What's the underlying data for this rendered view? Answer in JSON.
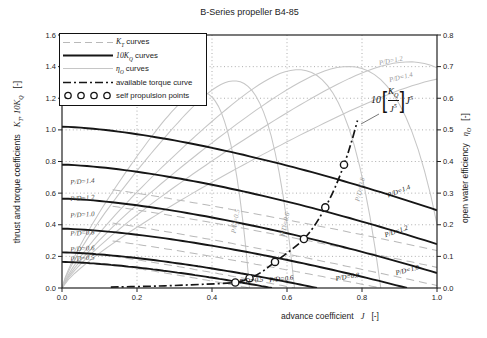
{
  "colors": {
    "curve_dark": "#161616",
    "curve_light": "#b9b9b9",
    "eta_light": "#c6c6c6",
    "grid": "#9a9a9a",
    "axis": "#222222",
    "text": "#1c1c1c",
    "label_gray": "#969696",
    "background": "#ffffff"
  },
  "chart_data": {
    "type": "line",
    "title": "B-Series propeller B4-85",
    "xlabel": {
      "text": "advance coefficient",
      "symbol": "J",
      "unit": "[-]"
    },
    "ylabel_left": {
      "text": "thrust and torque coefficients",
      "symbol": "K",
      "symbol_sub": "T",
      "symbol2": ", 10K",
      "symbol2_sub": "Q",
      "unit": "[-]"
    },
    "ylabel_right": {
      "text": "open water efficiency",
      "symbol": "η",
      "symbol_sub": "O",
      "unit": "[-]"
    },
    "xlim": [
      0,
      1.0
    ],
    "ylim_left": [
      0,
      1.6
    ],
    "ylim_right": [
      0,
      0.8
    ],
    "grid": "dotted",
    "legend_position": "upper-left",
    "xticks": [
      "0.0",
      "0.2",
      "0.4",
      "0.6",
      "0.8",
      "1.0"
    ],
    "yticks_left": [
      "0.0",
      "0.2",
      "0.4",
      "0.6",
      "0.8",
      "1.0",
      "1.2",
      "1.4",
      "1.6"
    ],
    "yticks_right": [
      "0.0",
      "0.1",
      "0.2",
      "0.3",
      "0.4",
      "0.5",
      "0.6",
      "0.7",
      "0.8"
    ],
    "pd_values": [
      0.5,
      0.6,
      0.8,
      1.0,
      1.2,
      1.4
    ],
    "kt_curves": {
      "start_values": [
        0.185,
        0.24,
        0.335,
        0.45,
        0.555,
        0.66
      ],
      "zero_crossings": [
        0.5,
        0.62,
        0.85,
        1.03,
        1.25,
        1.45
      ],
      "labels": [
        {
          "text": "P/D=0.5",
          "x": 0.055,
          "y": 0.175,
          "rot": -4
        },
        {
          "text": "P/D=0.6",
          "x": 0.055,
          "y": 0.235,
          "rot": -4
        },
        {
          "text": "P/D=0.8",
          "x": 0.055,
          "y": 0.335,
          "rot": -4
        },
        {
          "text": "P/D=1.0",
          "x": 0.055,
          "y": 0.45,
          "rot": -4
        },
        {
          "text": "P/D=1.2",
          "x": 0.055,
          "y": 0.555,
          "rot": -4
        },
        {
          "text": "P/D=1.4",
          "x": 0.055,
          "y": 0.66,
          "rot": -4
        }
      ]
    },
    "kq_curves": {
      "start_values": [
        0.165,
        0.225,
        0.375,
        0.565,
        0.78,
        1.02
      ],
      "zero_crossings": [
        0.56,
        0.68,
        0.92,
        1.13,
        1.34,
        1.55
      ],
      "labels": [
        {
          "text": "P/D=0.5",
          "x": 0.505,
          "y": 0.034,
          "rot": -5
        },
        {
          "text": "P/D=0.6",
          "x": 0.585,
          "y": 0.044,
          "rot": -6
        },
        {
          "text": "P/D=0.8",
          "x": 0.762,
          "y": 0.058,
          "rot": -9
        },
        {
          "text": "P/D=1.0",
          "x": 0.922,
          "y": 0.1,
          "rot": -15
        },
        {
          "text": "P/D=1.2",
          "x": 0.893,
          "y": 0.345,
          "rot": -19
        },
        {
          "text": "P/D=1.4",
          "x": 0.9,
          "y": 0.6,
          "rot": -21
        }
      ]
    },
    "eta_curves": {
      "peak_values": [
        0.62,
        0.655,
        0.69,
        0.7,
        0.715,
        0.67
      ],
      "zero_crossings": [
        0.5,
        0.62,
        0.85,
        1.03,
        1.25,
        1.45
      ],
      "labels": [
        {
          "text": "P/D=0.5",
          "x": 0.468,
          "y": 0.42,
          "rot": -80
        },
        {
          "text": "P/D=0.6",
          "x": 0.6,
          "y": 0.4,
          "rot": -78
        },
        {
          "text": "P/D=0.8",
          "x": 0.8,
          "y": 0.62,
          "rot": -77
        },
        {
          "text": "P/D=1.2",
          "x": 0.878,
          "y": 1.425,
          "rot": -12
        },
        {
          "text": "P/D=1.4",
          "x": 0.905,
          "y": 1.32,
          "rot": -14
        }
      ]
    },
    "torque_curve_points": [
      [
        0.13,
        0.006
      ],
      [
        0.22,
        0.01
      ],
      [
        0.3,
        0.016
      ],
      [
        0.38,
        0.024
      ],
      [
        0.462,
        0.035
      ],
      [
        0.5,
        0.062
      ],
      [
        0.535,
        0.105
      ],
      [
        0.568,
        0.165
      ],
      [
        0.608,
        0.235
      ],
      [
        0.645,
        0.31
      ],
      [
        0.675,
        0.4
      ],
      [
        0.702,
        0.51
      ],
      [
        0.728,
        0.635
      ],
      [
        0.752,
        0.78
      ],
      [
        0.772,
        0.925
      ],
      [
        0.788,
        1.06
      ]
    ],
    "self_propulsion_points": [
      [
        0.462,
        0.035
      ],
      [
        0.5,
        0.062
      ],
      [
        0.568,
        0.165
      ],
      [
        0.645,
        0.31
      ],
      [
        0.702,
        0.51
      ],
      [
        0.752,
        0.78
      ]
    ],
    "torque_label": {
      "coef": "10",
      "num": "K",
      "num_sub": "Q",
      "den": "J",
      "den_sup": "5",
      "tail": "J",
      "tail_sup": "5"
    },
    "legend": [
      {
        "main": "K",
        "sub": "T",
        "rest": " curves",
        "style": "kt"
      },
      {
        "main": "10K",
        "sub": "Q",
        "rest": " curves",
        "style": "kq"
      },
      {
        "main": "η",
        "sub": "O",
        "rest": " curves",
        "style": "eta"
      },
      {
        "main": "available torque curve",
        "sub": "",
        "rest": "",
        "style": "torque"
      },
      {
        "main": "self propulsion points",
        "sub": "",
        "rest": "",
        "style": "points"
      }
    ]
  }
}
